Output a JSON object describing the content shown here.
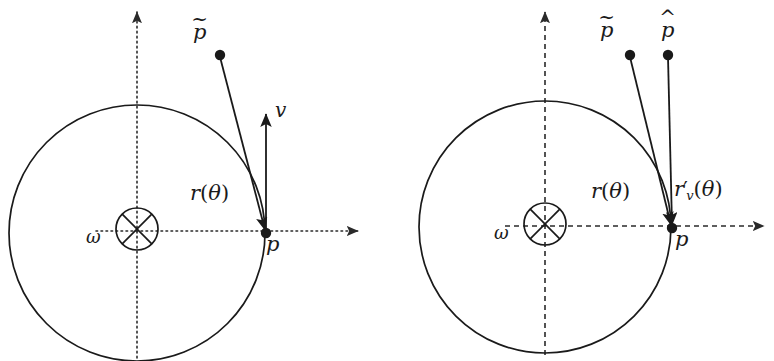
{
  "figure": {
    "type": "vector-diagram",
    "background_color": "#ffffff",
    "stroke_color": "#1a1a1a",
    "panels": [
      {
        "id": "left-panel",
        "name": "left-diagram",
        "circle": {
          "cx": 137,
          "cy": 233,
          "r": 128
        },
        "hub": {
          "cx": 137,
          "cy": 229,
          "r": 21,
          "style": "crossed-circle"
        },
        "axes": {
          "style": "dotted",
          "horizontal": {
            "x1": 96,
            "y1": 231,
            "x2": 362,
            "y2": 231
          },
          "vertical": {
            "x1": 137,
            "y1": 355,
            "x2": 137,
            "y2": 8
          }
        },
        "contact_point": {
          "x": 266,
          "y": 233
        },
        "ptilde_point": {
          "x": 220,
          "y": 55
        },
        "vectors": [
          {
            "name": "r-theta-vector",
            "from": [
              220,
              55
            ],
            "to": [
              266,
              233
            ],
            "arrow": "end"
          },
          {
            "name": "v-vector",
            "from": [
              266,
              233
            ],
            "to": [
              266,
              110
            ],
            "arrow": "end"
          }
        ],
        "labels": [
          {
            "name": "ptilde-label",
            "text": "p",
            "accent": "~",
            "x": 199,
            "y": 26
          },
          {
            "name": "v-label",
            "text": "v",
            "x": 276,
            "y": 105
          },
          {
            "name": "r-theta-label",
            "text": "r(θ)",
            "x": 193,
            "y": 186
          },
          {
            "name": "omega-label",
            "text": "ω",
            "x": 88,
            "y": 234
          },
          {
            "name": "p-label",
            "text": "p",
            "x": 267,
            "y": 239
          }
        ]
      },
      {
        "id": "right-panel",
        "name": "right-diagram",
        "circle": {
          "cx": 545,
          "cy": 227,
          "r": 126
        },
        "hub": {
          "cx": 545,
          "cy": 224,
          "r": 21,
          "style": "crossed-circle"
        },
        "axes": {
          "style": "dashed",
          "horizontal": {
            "x1": 505,
            "y1": 226,
            "x2": 768,
            "y2": 226
          },
          "vertical": {
            "x1": 545,
            "y1": 352,
            "x2": 545,
            "y2": 8
          }
        },
        "contact_point": {
          "x": 672,
          "y": 228
        },
        "ptilde_point": {
          "x": 630,
          "y": 55
        },
        "phat_point": {
          "x": 668,
          "y": 55
        },
        "vectors": [
          {
            "name": "r-theta-vector",
            "from": [
              630,
              55
            ],
            "to": [
              672,
              228
            ],
            "arrow": "end"
          },
          {
            "name": "r-prime-v-theta-vector",
            "from": [
              668,
              55
            ],
            "to": [
              672,
              228
            ],
            "arrow": "end"
          }
        ],
        "labels": [
          {
            "name": "ptilde-label",
            "text": "p",
            "accent": "~",
            "x": 605,
            "y": 24
          },
          {
            "name": "phat-label",
            "text": "p",
            "accent": "^",
            "x": 664,
            "y": 24
          },
          {
            "name": "r-theta-label",
            "text": "r(θ)",
            "x": 594,
            "y": 184
          },
          {
            "name": "r-prime-v-theta-label",
            "text": "r'_v(θ)",
            "x": 676,
            "y": 182
          },
          {
            "name": "omega-label",
            "text": "ω",
            "x": 496,
            "y": 230
          },
          {
            "name": "p-label",
            "text": "p",
            "x": 676,
            "y": 234
          }
        ]
      }
    ]
  },
  "text": {
    "p_tilde": "p",
    "p_hat": "p",
    "p": "p",
    "v": "v",
    "omega": "ω",
    "r_theta": "r",
    "theta": "θ",
    "open_paren": "(",
    "close_paren": ")",
    "prime": "′",
    "subscript_v": "v",
    "tilde_accent": "~",
    "hat_accent": "^"
  }
}
